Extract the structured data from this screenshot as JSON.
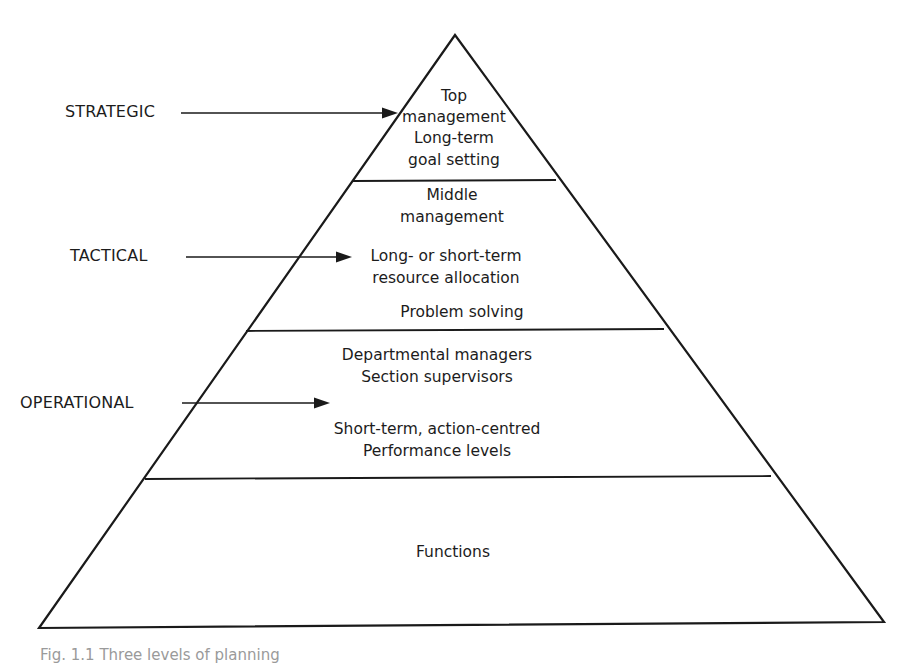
{
  "diagram": {
    "type": "pyramid",
    "colors": {
      "line": "#1a1a1a",
      "background": "#ffffff",
      "text": "#1c1c1c"
    },
    "levels": [
      {
        "name": "STRATEGIC",
        "tier_lines": [
          "Top",
          "management",
          "Long-term",
          "goal setting"
        ]
      },
      {
        "name": "TACTICAL",
        "tier_lines": [
          "Middle",
          "management",
          "Long- or short-term",
          "resource allocation",
          "Problem solving"
        ]
      },
      {
        "name": "OPERATIONAL",
        "tier_lines": [
          "Departmental managers",
          "Section supervisors",
          "Short-term, action-centred",
          "Performance levels"
        ]
      },
      {
        "name": "",
        "tier_lines": [
          "Functions"
        ]
      }
    ],
    "caption": "Fig. 1.1  Three levels of planning"
  }
}
